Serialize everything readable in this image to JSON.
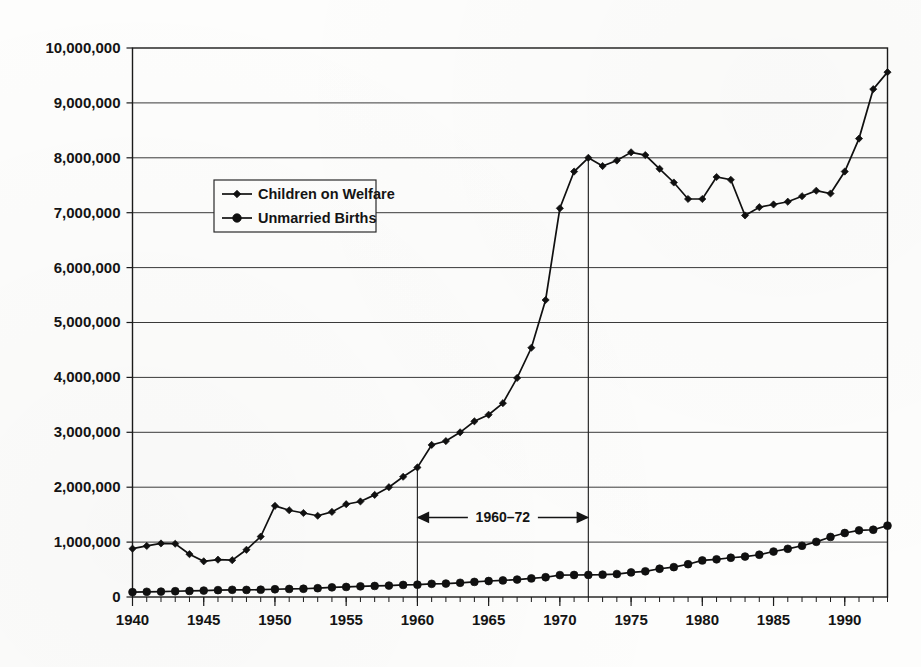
{
  "chart_data": {
    "type": "line",
    "title": "",
    "xlabel": "",
    "ylabel": "",
    "xlim": [
      1940,
      1993
    ],
    "ylim": [
      0,
      10000000
    ],
    "grid": true,
    "legend_position": "inside-upper-left",
    "y_ticks": [
      0,
      1000000,
      2000000,
      3000000,
      4000000,
      5000000,
      6000000,
      7000000,
      8000000,
      9000000,
      10000000
    ],
    "y_tick_labels": [
      "0",
      "1,000,000",
      "2,000,000",
      "3,000,000",
      "4,000,000",
      "5,000,000",
      "6,000,000",
      "7,000,000",
      "8,000,000",
      "9,000,000",
      "10,000,000"
    ],
    "x_ticks": [
      1940,
      1945,
      1950,
      1955,
      1960,
      1965,
      1970,
      1975,
      1980,
      1985,
      1990
    ],
    "x_tick_labels": [
      "1940",
      "1945",
      "1950",
      "1955",
      "1960",
      "1965",
      "1970",
      "1975",
      "1980",
      "1985",
      "1990"
    ],
    "x_minor_tick_interval": 1,
    "x": [
      1940,
      1941,
      1942,
      1943,
      1944,
      1945,
      1946,
      1947,
      1948,
      1949,
      1950,
      1951,
      1952,
      1953,
      1954,
      1955,
      1956,
      1957,
      1958,
      1959,
      1960,
      1961,
      1962,
      1963,
      1964,
      1965,
      1966,
      1967,
      1968,
      1969,
      1970,
      1971,
      1972,
      1973,
      1974,
      1975,
      1976,
      1977,
      1978,
      1979,
      1980,
      1981,
      1982,
      1983,
      1984,
      1985,
      1986,
      1987,
      1988,
      1989,
      1990,
      1991,
      1992,
      1993
    ],
    "series": [
      {
        "name": "Children on Welfare",
        "marker": "diamond",
        "values": [
          880000,
          930000,
          975000,
          970000,
          780000,
          650000,
          680000,
          670000,
          860000,
          1100000,
          1660000,
          1580000,
          1530000,
          1480000,
          1550000,
          1690000,
          1740000,
          1860000,
          2000000,
          2190000,
          2360000,
          2770000,
          2840000,
          3000000,
          3200000,
          3320000,
          3530000,
          3990000,
          4540000,
          5410000,
          7080000,
          7750000,
          8000000,
          7850000,
          7950000,
          8100000,
          8050000,
          7800000,
          7550000,
          7250000,
          7250000,
          7650000,
          7600000,
          6950000,
          7100000,
          7150000,
          7200000,
          7300000,
          7400000,
          7350000,
          7750000,
          8350000,
          9250000,
          9560000
        ]
      },
      {
        "name": "Unmarried Births",
        "marker": "circle",
        "values": [
          89500,
          95000,
          98000,
          105000,
          110000,
          117000,
          125000,
          131000,
          129000,
          133000,
          141600,
          146500,
          150000,
          160000,
          176000,
          183000,
          194000,
          201000,
          208000,
          220000,
          224300,
          240000,
          245000,
          259000,
          275000,
          291000,
          302000,
          318000,
          339000,
          360000,
          398700,
          401000,
          403000,
          407000,
          418000,
          447900,
          468000,
          515000,
          544000,
          597000,
          665700,
          686000,
          715000,
          737000,
          770000,
          828200,
          878000,
          933000,
          1005000,
          1094000,
          1165400,
          1214000,
          1225000,
          1300000
        ]
      }
    ],
    "annotations": [
      {
        "text": "1960–72",
        "type": "span-arrow",
        "x_start": 1960,
        "x_end": 1972,
        "y": 1450000,
        "reference_lines": [
          {
            "x": 1960,
            "y_top": 2360000
          },
          {
            "x": 1972,
            "y_top": 8000000
          }
        ]
      }
    ]
  },
  "legend": {
    "items": [
      {
        "label": "Children on Welfare",
        "marker": "diamond-marker-icon"
      },
      {
        "label": "Unmarried Births",
        "marker": "circle-marker-icon"
      }
    ]
  },
  "colors": {
    "line": "#101010",
    "grid": "#3a3a3a",
    "frame": "#1a1a1a",
    "background": "#fdfdfc",
    "text": "#141414"
  }
}
